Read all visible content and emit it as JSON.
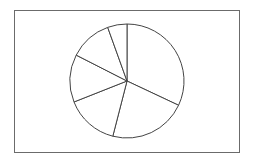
{
  "chart_data": {
    "type": "pie",
    "title": "",
    "categories": [
      "Slice 1",
      "Slice 2",
      "Slice 3",
      "Slice 4",
      "Slice 5",
      "Slice 6"
    ],
    "values": [
      32,
      22,
      15,
      13.5,
      12,
      5.5
    ],
    "start_angle_deg": 0,
    "direction": "clockwise",
    "legend": "none",
    "labels_shown": false,
    "fill_color": "#ffffff",
    "stroke_color": "#444444"
  },
  "layout": {
    "center": [
      127,
      81
    ],
    "radius": 57
  }
}
